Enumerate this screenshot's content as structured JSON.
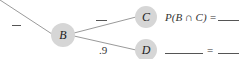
{
  "diagram": {
    "type": "probability-tree",
    "nodes": [
      {
        "id": "B",
        "label": "B"
      },
      {
        "id": "C",
        "label": "C"
      },
      {
        "id": "D",
        "label": "D"
      }
    ],
    "edges": [
      {
        "from": "root",
        "to": "B",
        "label": "—"
      },
      {
        "from": "B",
        "to": "C",
        "label": "—"
      },
      {
        "from": "B",
        "to": "D",
        "label": ".9"
      }
    ],
    "results": {
      "c_expression": "P(B ∩ C) =",
      "d_equals": "="
    }
  },
  "colors": {
    "node_fill": "#d6d6d6",
    "line": "#9a9a9a",
    "text": "#333333"
  }
}
